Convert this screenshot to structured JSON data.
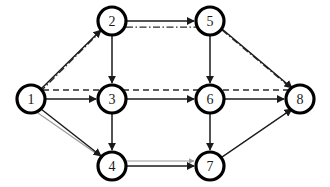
{
  "diagram": {
    "type": "directed-graph",
    "canvas": {
      "width": 330,
      "height": 187,
      "background": "#ffffff"
    },
    "node_radius": 14,
    "colors": {
      "node_fill": "#ffffff",
      "node_stroke": "#000000",
      "label": "#1a1a1a",
      "edge_solid": "#1a1a1a",
      "edge_overlay": "#2b2b2b",
      "edge_ghost": "#9a9a9a"
    },
    "nodes": [
      {
        "id": "1",
        "label": "1",
        "x": 31,
        "y": 99
      },
      {
        "id": "2",
        "label": "2",
        "x": 112,
        "y": 21
      },
      {
        "id": "3",
        "label": "3",
        "x": 112,
        "y": 99
      },
      {
        "id": "4",
        "label": "4",
        "x": 112,
        "y": 166
      },
      {
        "id": "5",
        "label": "5",
        "x": 210,
        "y": 21
      },
      {
        "id": "6",
        "label": "6",
        "x": 210,
        "y": 99
      },
      {
        "id": "7",
        "label": "7",
        "x": 210,
        "y": 166
      },
      {
        "id": "8",
        "label": "8",
        "x": 300,
        "y": 99
      }
    ],
    "edges": [
      {
        "from": "1",
        "to": "2",
        "style": "solid",
        "arrow": true
      },
      {
        "from": "1",
        "to": "3",
        "style": "solid",
        "arrow": true
      },
      {
        "from": "1",
        "to": "4",
        "style": "solid",
        "arrow": true
      },
      {
        "from": "2",
        "to": "3",
        "style": "solid",
        "arrow": true
      },
      {
        "from": "2",
        "to": "5",
        "style": "solid",
        "arrow": true
      },
      {
        "from": "3",
        "to": "4",
        "style": "solid",
        "arrow": true
      },
      {
        "from": "3",
        "to": "6",
        "style": "solid",
        "arrow": true
      },
      {
        "from": "4",
        "to": "7",
        "style": "solid",
        "arrow": true
      },
      {
        "from": "5",
        "to": "6",
        "style": "solid",
        "arrow": true
      },
      {
        "from": "5",
        "to": "8",
        "style": "solid",
        "arrow": true
      },
      {
        "from": "6",
        "to": "7",
        "style": "solid",
        "arrow": true
      },
      {
        "from": "6",
        "to": "8",
        "style": "solid",
        "arrow": true
      },
      {
        "from": "7",
        "to": "8",
        "style": "solid",
        "arrow": true
      }
    ],
    "overlay_paths": [
      {
        "id": "path-dashdot-1-2",
        "style": "dash-dot",
        "along": [
          "1",
          "2"
        ]
      },
      {
        "id": "path-dashdot-2-5",
        "style": "dash-dot",
        "along": [
          "2",
          "5"
        ]
      },
      {
        "id": "path-dashdot-5-8",
        "style": "dash-dot",
        "along": [
          "5",
          "8"
        ]
      },
      {
        "id": "path-dashed-1-8",
        "style": "dashed",
        "along": [
          "1",
          "3",
          "6",
          "8"
        ]
      },
      {
        "id": "path-ghost-1-4",
        "style": "ghost",
        "along": [
          "1",
          "4"
        ]
      },
      {
        "id": "path-ghost-4-7",
        "style": "ghost",
        "along": [
          "4",
          "7"
        ]
      },
      {
        "id": "path-ghost-7-8",
        "style": "ghost",
        "along": [
          "7",
          "8"
        ]
      }
    ]
  }
}
